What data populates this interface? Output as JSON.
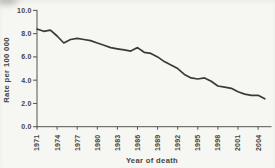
{
  "figure": {
    "background_color": "#f6f6f2",
    "line_color": "#3a3a3a",
    "axis_color": "#555250",
    "text_color": "#454545"
  },
  "chart_data": {
    "type": "line",
    "title": "",
    "xlabel": "Year of death",
    "ylabel": "Rate per 100 000",
    "x": [
      1971,
      1972,
      1973,
      1974,
      1975,
      1976,
      1977,
      1978,
      1979,
      1980,
      1981,
      1982,
      1983,
      1984,
      1985,
      1986,
      1987,
      1988,
      1989,
      1990,
      1991,
      1992,
      1993,
      1994,
      1995,
      1996,
      1997,
      1998,
      1999,
      2000,
      2001,
      2002,
      2003,
      2004,
      2005
    ],
    "values": [
      8.4,
      8.2,
      8.3,
      7.8,
      7.2,
      7.5,
      7.6,
      7.5,
      7.4,
      7.2,
      7.0,
      6.8,
      6.7,
      6.6,
      6.5,
      6.8,
      6.4,
      6.3,
      6.0,
      5.6,
      5.3,
      5.0,
      4.5,
      4.2,
      4.1,
      4.2,
      3.9,
      3.5,
      3.4,
      3.3,
      3.0,
      2.8,
      2.7,
      2.7,
      2.4
    ],
    "xlim": [
      1971,
      2006
    ],
    "ylim": [
      0,
      10
    ],
    "x_ticks": [
      1971,
      1974,
      1977,
      1980,
      1983,
      1986,
      1989,
      1992,
      1995,
      1998,
      2001,
      2004
    ],
    "x_tick_labels": [
      "1971",
      "1974",
      "1977",
      "1980",
      "1983",
      "1986",
      "1989",
      "1992",
      "1995",
      "1998",
      "2001",
      "2004"
    ],
    "y_ticks": [
      0,
      2,
      4,
      6,
      8,
      10
    ],
    "y_tick_labels": [
      "0.0",
      "2.0",
      "4.0",
      "6.0",
      "8.0",
      "10.0"
    ],
    "grid": false,
    "legend": "none"
  }
}
